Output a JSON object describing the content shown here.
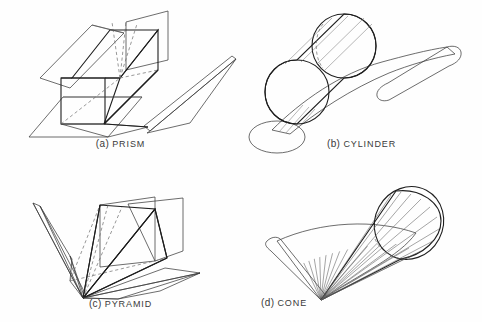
{
  "page": {
    "background_color": "#fefefe",
    "width": 482,
    "height": 322
  },
  "figures": [
    {
      "id": "prism",
      "index_label": "(a)",
      "name_label": "PRISM",
      "caption": "(a) PRISM",
      "description": "Triangular-faced prism shown with its lateral surfaces unfolded flat, dashed hidden edges from the interior apex"
    },
    {
      "id": "cylinder",
      "index_label": "(b)",
      "name_label": "CYLINDER",
      "caption": "(b) CYLINDER",
      "description": "Right circular cylinder with its lateral surface unrolled into a hatched curved sheet, circular end face and base ellipse shown"
    },
    {
      "id": "pyramid",
      "index_label": "(c)",
      "name_label": "PYRAMID",
      "caption": "(c) PYRAMID",
      "description": "Rectangular pyramid with triangular lateral faces unfolded outward about the base edges, dashed hidden edges at base"
    },
    {
      "id": "cone",
      "index_label": "(d)",
      "name_label": "CONE",
      "caption": "(d) CONE",
      "description": "Right circular cone with its lateral surface unrolled into a radially ruled fan sector sharing the apex"
    }
  ],
  "style": {
    "line_color": "#1e1e1e",
    "hidden_line_color": "#6b6b6b",
    "hatch_color": "#6f6f6f",
    "caption_color": "#3a3a3a"
  }
}
